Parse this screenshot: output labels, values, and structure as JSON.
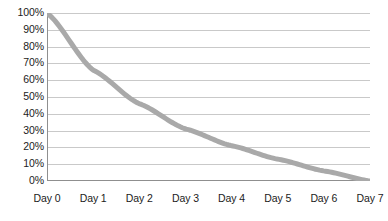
{
  "chart_data": {
    "type": "line",
    "title": "",
    "subtitle": "",
    "xlabel": "",
    "ylabel": "",
    "x": [
      0,
      1,
      2,
      3,
      4,
      5,
      6,
      7
    ],
    "categories": [
      "Day 0",
      "Day 1",
      "Day 2",
      "Day 3",
      "Day 4",
      "Day 5",
      "Day 6",
      "Day 7"
    ],
    "series": [
      {
        "name": "Retention",
        "values": [
          100,
          66,
          46,
          31,
          21,
          13,
          6,
          0
        ]
      }
    ],
    "y_tick_labels": [
      "100%",
      "90%",
      "80%",
      "70%",
      "60%",
      "50%",
      "40%",
      "30%",
      "20%",
      "10%",
      "0%"
    ],
    "y_tick_values": [
      100,
      90,
      80,
      70,
      60,
      50,
      40,
      30,
      20,
      10,
      0
    ],
    "x_tick_labels": [
      "Day 0",
      "Day 1",
      "Day 2",
      "Day 3",
      "Day 4",
      "Day 5",
      "Day 6",
      "Day 7"
    ],
    "ylim": [
      0,
      100
    ],
    "xlim": [
      0,
      7
    ],
    "grid": "horizontal",
    "legend": "none",
    "line_color": "#a9a9a9",
    "grid_color": "#c9c9c9",
    "axis_color": "#8f8f8f",
    "background_color": "#ffffff",
    "text_color": "#1b1b1b",
    "line_width": 5,
    "annotations": []
  },
  "axis": {
    "y_labels": [
      {
        "text": "100%",
        "value": 100
      },
      {
        "text": "90%",
        "value": 90
      },
      {
        "text": "80%",
        "value": 80
      },
      {
        "text": "70%",
        "value": 70
      },
      {
        "text": "60%",
        "value": 60
      },
      {
        "text": "50%",
        "value": 50
      },
      {
        "text": "40%",
        "value": 40
      },
      {
        "text": "30%",
        "value": 30
      },
      {
        "text": "20%",
        "value": 20
      },
      {
        "text": "10%",
        "value": 10
      },
      {
        "text": "0%",
        "value": 0
      }
    ],
    "x_labels": [
      {
        "text": "Day 0",
        "value": 0
      },
      {
        "text": "Day 1",
        "value": 1
      },
      {
        "text": "Day 2",
        "value": 2
      },
      {
        "text": "Day 3",
        "value": 3
      },
      {
        "text": "Day 4",
        "value": 4
      },
      {
        "text": "Day 5",
        "value": 5
      },
      {
        "text": "Day 6",
        "value": 6
      },
      {
        "text": "Day 7",
        "value": 7
      }
    ]
  }
}
